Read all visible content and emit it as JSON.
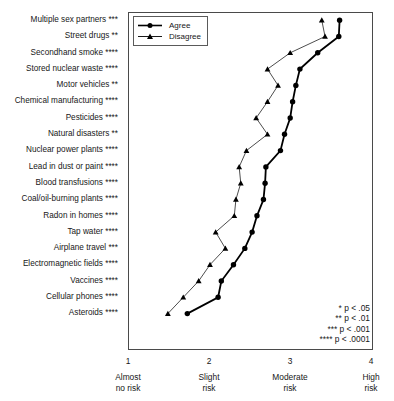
{
  "chart_data": {
    "type": "line",
    "title": "",
    "subtitle": "",
    "xlabel": "",
    "ylabel": "",
    "xlim": [
      1,
      4
    ],
    "grid": false,
    "orientation": "horizontal",
    "legend_position": "top-left",
    "xtick_values": [
      1,
      2,
      3,
      4
    ],
    "xtick_labels": [
      "1",
      "2",
      "3",
      "4"
    ],
    "xtick_captions": [
      {
        "line1": "Almost",
        "line2": "no risk"
      },
      {
        "line1": "Slight",
        "line2": "risk"
      },
      {
        "line1": "Moderate",
        "line2": "risk"
      },
      {
        "line1": "High",
        "line2": "risk"
      }
    ],
    "categories": [
      "Multiple sex partners",
      "Street drugs",
      "Secondhand smoke",
      "Stored nuclear waste",
      "Motor vehicles",
      "Chemical manufacturing",
      "Pesticides",
      "Natural disasters",
      "Nuclear power plants",
      "Lead in dust or paint",
      "Blood transfusions",
      "Coal/oil-burning plants",
      "Radon in homes",
      "Tap water",
      "Airplane travel",
      "Electromagnetic fields",
      "Vaccines",
      "Cellular phones",
      "Asteroids"
    ],
    "category_significance": [
      "***",
      "**",
      "****",
      "****",
      "**",
      "****",
      "****",
      "**",
      "****",
      "****",
      "****",
      "****",
      "****",
      "****",
      "***",
      "****",
      "****",
      "****",
      "****"
    ],
    "category_labels_full": [
      "Multiple sex partners ***",
      "Street drugs **",
      "Secondhand smoke ****",
      "Stored nuclear waste ****",
      "Motor vehicles **",
      "Chemical manufacturing ****",
      "Pesticides ****",
      "Natural disasters **",
      "Nuclear power plants ****",
      "Lead in dust or paint ****",
      "Blood transfusions ****",
      "Coal/oil-burning plants ****",
      "Radon in homes ****",
      "Tap water ****",
      "Airplane travel ***",
      "Electromagnetic fields ****",
      "Vaccines ****",
      "Cellular phones ****",
      "Asteroids ****"
    ],
    "series": [
      {
        "name": "Agree",
        "marker": "filled-circle",
        "color": "#000000",
        "line_width": 1.8,
        "values": [
          3.6,
          3.59,
          3.33,
          3.11,
          3.06,
          3.02,
          2.99,
          2.92,
          2.87,
          2.69,
          2.68,
          2.66,
          2.58,
          2.52,
          2.43,
          2.29,
          2.14,
          2.1,
          1.72
        ]
      },
      {
        "name": "Disagree",
        "marker": "filled-triangle",
        "color": "#000000",
        "line_width": 0.7,
        "values": [
          3.38,
          3.42,
          2.99,
          2.71,
          2.84,
          2.71,
          2.57,
          2.71,
          2.45,
          2.36,
          2.38,
          2.32,
          2.3,
          2.07,
          2.19,
          2.0,
          1.86,
          1.67,
          1.48
        ]
      }
    ],
    "annotations": {
      "pvalue_notes": [
        "* p < .05",
        "** p < .01",
        "*** p < .001",
        "**** p < .0001"
      ]
    }
  },
  "legend": {
    "entries": [
      {
        "label": "Agree",
        "marker": "filled-circle"
      },
      {
        "label": "Disagree",
        "marker": "filled-triangle"
      }
    ]
  }
}
